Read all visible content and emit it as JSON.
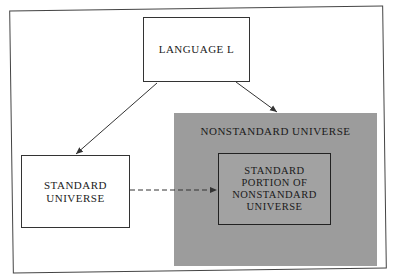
{
  "diagram": {
    "nodes": {
      "language": {
        "label": "LANGUAGE L"
      },
      "standard_universe": {
        "label_lines": [
          "STANDARD",
          "UNIVERSE"
        ]
      },
      "nonstandard_universe": {
        "label": "NONSTANDARD UNIVERSE"
      },
      "standard_portion": {
        "label_lines": [
          "STANDARD",
          "PORTION OF",
          "NONSTANDARD",
          "UNIVERSE"
        ]
      }
    },
    "edges": [
      {
        "from": "LANGUAGE L",
        "to": "STANDARD UNIVERSE",
        "style": "solid"
      },
      {
        "from": "LANGUAGE L",
        "to": "NONSTANDARD UNIVERSE",
        "style": "solid"
      },
      {
        "from": "STANDARD UNIVERSE",
        "to": "STANDARD PORTION OF NONSTANDARD UNIVERSE",
        "style": "dashed"
      }
    ],
    "colors": {
      "nonstandard_fill": "#9c9c9c",
      "line": "#333333"
    }
  }
}
